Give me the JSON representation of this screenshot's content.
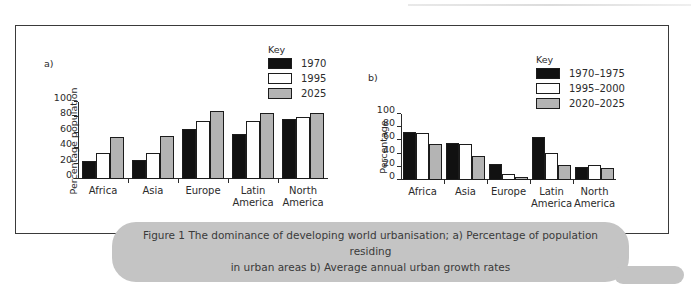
{
  "figure": {
    "panel_a_letter": "a)",
    "panel_b_letter": "b)",
    "caption_line1": "Figure 1  The dominance of developing world urbanisation; a) Percentage of population residing",
    "caption_line2": "in urban areas b) Average annual urban growth rates"
  },
  "colors": {
    "series_1": "#111111",
    "series_2": "#ffffff",
    "series_3": "#b4b4b4",
    "outline": "#1c1c1c",
    "caption_background": "#c4c4c4",
    "frame": "#3a3a3a"
  },
  "chart_data": [
    {
      "type": "bar",
      "id": "panel-a",
      "title": "",
      "legend_title": "Key",
      "legend_position": "top-right",
      "xlabel": "",
      "ylabel": "Percentage population",
      "ylim": [
        0,
        100
      ],
      "yticks": [
        0,
        20,
        40,
        60,
        80,
        100
      ],
      "grid": false,
      "categories": [
        "Africa",
        "Asia",
        "Europe",
        "Latin America",
        "North America"
      ],
      "series": [
        {
          "name": "1970",
          "values": [
            23,
            25,
            65,
            59,
            78
          ]
        },
        {
          "name": "1995",
          "values": [
            34,
            34,
            75,
            75,
            80
          ]
        },
        {
          "name": "2025",
          "values": [
            54,
            56,
            88,
            86,
            86
          ]
        }
      ]
    },
    {
      "type": "bar",
      "id": "panel-b",
      "title": "",
      "legend_title": "Key",
      "legend_position": "top-right",
      "xlabel": "",
      "ylabel": "Percentage",
      "ylim": [
        0,
        100
      ],
      "yticks": [
        0,
        20,
        40,
        60,
        80,
        100
      ],
      "grid": false,
      "categories": [
        "Africa",
        "Asia",
        "Europe",
        "Latin America",
        "North America"
      ],
      "series": [
        {
          "name": "1970–1975",
          "values": [
            73,
            56,
            25,
            65,
            20
          ]
        },
        {
          "name": "1995–2000",
          "values": [
            71,
            55,
            9,
            41,
            22
          ]
        },
        {
          "name": "2020–2025",
          "values": [
            54,
            36,
            5,
            22,
            18
          ]
        }
      ]
    }
  ]
}
